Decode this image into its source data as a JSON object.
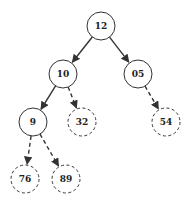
{
  "diagram": {
    "type": "binary-tree",
    "colors": {
      "stroke": "#333333",
      "background": "#ffffff",
      "text": "#222222"
    },
    "nodes": [
      {
        "id": "n12",
        "label": "12",
        "x": 101,
        "y": 26,
        "style": "solid"
      },
      {
        "id": "n10",
        "label": "10",
        "x": 63,
        "y": 74,
        "style": "solid"
      },
      {
        "id": "n05",
        "label": "05",
        "x": 138,
        "y": 74,
        "style": "solid"
      },
      {
        "id": "n9",
        "label": "9",
        "x": 33,
        "y": 122,
        "style": "solid"
      },
      {
        "id": "n32",
        "label": "32",
        "x": 82,
        "y": 122,
        "style": "dashed"
      },
      {
        "id": "n54",
        "label": "54",
        "x": 166,
        "y": 122,
        "style": "dashed"
      },
      {
        "id": "n76",
        "label": "76",
        "x": 25,
        "y": 179,
        "style": "dashed"
      },
      {
        "id": "n89",
        "label": "89",
        "x": 66,
        "y": 179,
        "style": "dashed"
      }
    ],
    "edges": [
      {
        "from": "n12",
        "to": "n10",
        "style": "solid"
      },
      {
        "from": "n12",
        "to": "n05",
        "style": "solid"
      },
      {
        "from": "n10",
        "to": "n9",
        "style": "solid"
      },
      {
        "from": "n10",
        "to": "n32",
        "style": "dashed"
      },
      {
        "from": "n05",
        "to": "n54",
        "style": "dashed"
      },
      {
        "from": "n9",
        "to": "n76",
        "style": "dashed"
      },
      {
        "from": "n9",
        "to": "n89",
        "style": "dashed"
      }
    ]
  }
}
